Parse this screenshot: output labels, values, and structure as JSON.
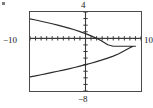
{
  "figure": {
    "kind": "graphing-calculator-window",
    "frame": {
      "x": 29,
      "y": 11,
      "width": 113,
      "height": 81
    }
  },
  "labels": {
    "top": "4",
    "bottom": "−8",
    "left": "−10",
    "right": "10"
  },
  "chart_data": {
    "type": "line",
    "title": "",
    "xlabel": "",
    "ylabel": "",
    "xlim": [
      -10,
      10
    ],
    "ylim": [
      -8,
      4
    ],
    "grid": false,
    "legend": null,
    "axes": {
      "x_axis_value": 0,
      "y_axis_value": 0,
      "x_tick_interval": 1,
      "y_tick_interval": 1,
      "tick_marks": true
    },
    "tick_labels": {
      "x": [
        "−10",
        "10"
      ],
      "y": [
        "−8",
        "4"
      ]
    },
    "annotations": [],
    "series": [
      {
        "name": "sideways parabola (opens left)",
        "orientation": "horizontal",
        "vertex": [
          9.0,
          -1.2
        ],
        "x": [
          -10.0,
          -9.0,
          -8.0,
          -7.0,
          -6.0,
          -5.0,
          -4.0,
          -3.0,
          -2.0,
          -1.0,
          0.0,
          1.0,
          2.0,
          3.0,
          4.0,
          5.0,
          6.0,
          7.0,
          8.0,
          8.6,
          9.0,
          8.6,
          8.0,
          7.0,
          6.0,
          5.0,
          4.0,
          3.0,
          2.0,
          1.0,
          0.0,
          -1.0,
          -2.0,
          -3.0,
          -4.0,
          -5.0,
          -6.0,
          -7.0,
          -8.0,
          -9.0,
          -10.0
        ],
        "y": [
          2.95,
          2.78,
          2.6,
          2.41,
          2.22,
          2.01,
          1.79,
          1.55,
          1.3,
          1.02,
          0.72,
          0.38,
          0.0,
          -0.45,
          -0.97,
          -1.2,
          -1.2,
          -1.2,
          -1.2,
          -1.2,
          -1.2,
          -1.2,
          -1.43,
          -1.9,
          -2.35,
          -2.7,
          -3.0,
          -3.28,
          -3.54,
          -3.78,
          -4.0,
          -4.22,
          -4.43,
          -4.63,
          -4.82,
          -5.0,
          -5.18,
          -5.36,
          -5.53,
          -5.7,
          -5.86
        ]
      }
    ]
  }
}
